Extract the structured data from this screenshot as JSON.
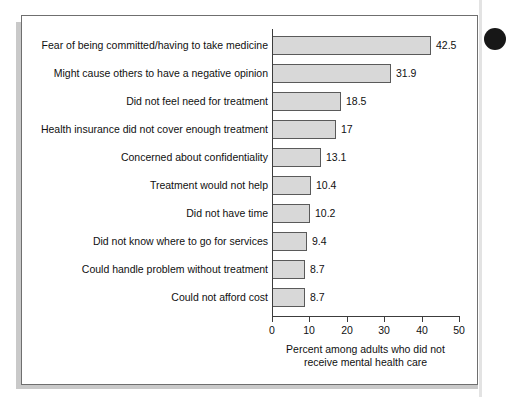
{
  "figure": {
    "edge_dot_name": "page-punch-dot"
  },
  "chart_data": {
    "type": "bar",
    "orientation": "horizontal",
    "title": "",
    "subtitle": "",
    "xlabel_line1": "Percent among adults who did not",
    "xlabel_line2": "receive mental health care",
    "ylabel": "",
    "xlim": [
      0,
      50
    ],
    "grid": false,
    "legend": null,
    "xticks": [
      0,
      10,
      20,
      30,
      40,
      50
    ],
    "xtick_labels": [
      "0",
      "10",
      "20",
      "30",
      "40",
      "50"
    ],
    "categories": [
      "Fear of being committed/having to take medicine",
      "Might cause others to have a negative opinion",
      "Did not feel need for treatment",
      "Health insurance did not cover enough treatment",
      "Concerned about confidentiality",
      "Treatment would not help",
      "Did not have time",
      "Did not know where to go for services",
      "Could handle problem without treatment",
      "Could not afford cost"
    ],
    "values": [
      42.5,
      31.9,
      18.5,
      17,
      13.1,
      10.4,
      10.2,
      9.4,
      8.7,
      8.7
    ],
    "value_labels": [
      "42.5",
      "31.9",
      "18.5",
      "17",
      "13.1",
      "10.4",
      "10.2",
      "9.4",
      "8.7",
      "8.7"
    ],
    "bar_fill_color": "#d8d8d8",
    "bar_border_color": "#5a5a5a",
    "axis_color": "#3c3c3c",
    "text_color": "#101010",
    "background_color": "#ffffff"
  }
}
